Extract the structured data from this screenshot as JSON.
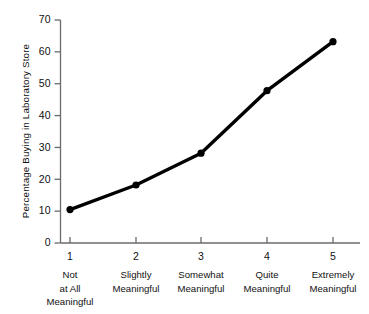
{
  "chart_data": {
    "type": "line",
    "title": "",
    "xlabel": "",
    "ylabel": "Percentage Buying in Laboratory Store",
    "xlim": [
      0.6,
      5.55
    ],
    "ylim": [
      0,
      70
    ],
    "grid": false,
    "legend": null,
    "x": [
      1,
      2,
      3,
      4,
      5
    ],
    "categories": [
      "1",
      "2",
      "3",
      "4",
      "5"
    ],
    "category_descriptions": [
      [
        "Not",
        "at All",
        "Meaningful"
      ],
      [
        "Slightly",
        "Meaningful"
      ],
      [
        "Somewhat",
        "Meaningful"
      ],
      [
        "Quite",
        "Meaningful"
      ],
      [
        "Extremely",
        "Meaningful"
      ]
    ],
    "values": [
      10.5,
      18.2,
      28.2,
      47.8,
      63.2
    ],
    "series": [
      {
        "name": "Percentage Buying in Laboratory Store",
        "values": [
          10.5,
          18.2,
          28.2,
          47.8,
          63.2
        ],
        "color": "#000000",
        "marker": "filled-circle",
        "line_width": 3.4
      }
    ],
    "y_ticks": [
      0,
      10,
      20,
      30,
      40,
      50,
      60,
      70
    ],
    "y_tick_labels": [
      "0",
      "10",
      "20",
      "30",
      "40",
      "50",
      "60",
      "70"
    ],
    "x_ticks": [
      1,
      2,
      3,
      4,
      5
    ],
    "x_tick_labels": [
      "1",
      "2",
      "3",
      "4",
      "5"
    ],
    "axis_color": "#6b6b6b",
    "line_color": "#000000",
    "background_color": "#ffffff"
  }
}
